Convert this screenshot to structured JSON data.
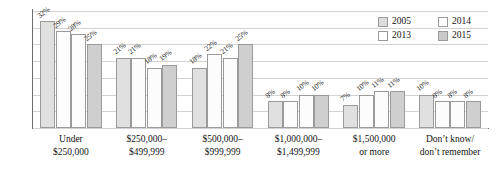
{
  "legend": {
    "position": "top-right",
    "entries": [
      {
        "label": "2005",
        "color": "#dcdcdc"
      },
      {
        "label": "2013",
        "color": "#ffffff"
      },
      {
        "label": "2014",
        "color": "#ffffff"
      },
      {
        "label": "2015",
        "color": "#c9c9c9"
      }
    ]
  },
  "axis": {
    "gridlines_visible": true,
    "y_tick_labels": []
  },
  "categories_lines": [
    [
      "Under",
      "$250,000"
    ],
    [
      "$250,000–",
      "$499,999"
    ],
    [
      "$500,000–",
      "$999,999"
    ],
    [
      "$1,000,000–",
      "$1,499,999"
    ],
    [
      "$1,500,000",
      "or more"
    ],
    [
      "Don’t know/",
      "don’t remember"
    ]
  ],
  "bar_labels": [
    [
      "32%",
      "29%",
      "28%",
      "25%"
    ],
    [
      "21%",
      "21%",
      "18%",
      "19%"
    ],
    [
      "18%",
      "22%",
      "21%",
      "25%"
    ],
    [
      "8%",
      "8%",
      "10%",
      "10%"
    ],
    [
      "7%",
      "10%",
      "11%",
      "11%"
    ],
    [
      "10%",
      "8%",
      "8%",
      "8%"
    ]
  ],
  "chart_data": {
    "type": "bar",
    "title": "",
    "xlabel": "",
    "ylabel": "",
    "ylim": [
      0,
      35
    ],
    "grid": true,
    "legend_position": "top-right",
    "categories": [
      "Under $250,000",
      "$250,000–$499,999",
      "$500,000–$999,999",
      "$1,000,000–$1,499,999",
      "$1,500,000 or more",
      "Don’t know/don’t remember"
    ],
    "series": [
      {
        "name": "2005",
        "values": [
          32,
          21,
          18,
          8,
          7,
          10
        ],
        "color": "#dcdcdc"
      },
      {
        "name": "2013",
        "values": [
          29,
          21,
          22,
          8,
          10,
          8
        ],
        "color": "#ffffff"
      },
      {
        "name": "2014",
        "values": [
          28,
          18,
          21,
          10,
          11,
          8
        ],
        "color": "#ffffff"
      },
      {
        "name": "2015",
        "values": [
          25,
          19,
          25,
          10,
          11,
          8
        ],
        "color": "#c9c9c9"
      }
    ],
    "value_labels": [
      "32%",
      "29%",
      "28%",
      "25%",
      "21%",
      "21%",
      "18%",
      "19%",
      "18%",
      "22%",
      "21%",
      "25%",
      "8%",
      "8%",
      "10%",
      "10%",
      "7%",
      "10%",
      "11%",
      "11%",
      "10%",
      "8%",
      "8%",
      "8%"
    ]
  }
}
